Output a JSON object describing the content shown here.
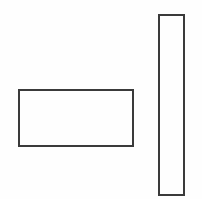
{
  "diagram": {
    "background": "#fefefe",
    "stroke_color": "#3a3a3a",
    "shapes": [
      {
        "id": "horizontal-rectangle",
        "type": "rectangle",
        "x": 18,
        "y": 89,
        "width": 116,
        "height": 58,
        "stroke_width": 2
      },
      {
        "id": "vertical-rectangle",
        "type": "rectangle",
        "x": 158,
        "y": 14,
        "width": 27,
        "height": 182,
        "stroke_width": 2
      }
    ]
  }
}
